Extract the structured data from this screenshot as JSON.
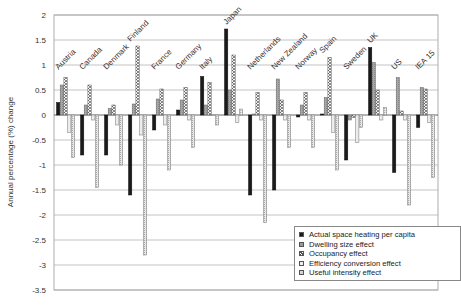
{
  "chart_data": {
    "type": "bar",
    "title": "",
    "xlabel": "",
    "ylabel": "Annual percentage (%) change",
    "ylim": [
      -3.5,
      2
    ],
    "yticks": [
      2,
      1.5,
      1,
      0.5,
      0,
      -0.5,
      -1,
      -1.5,
      -2,
      -2.5,
      -3,
      -3.5
    ],
    "grid": true,
    "legend_position": "lower right",
    "categories": [
      "Austria",
      "Canada",
      "Denmark",
      "Finland",
      "France",
      "Germany",
      "Italy",
      "Japan",
      "Netherlands",
      "New Zealand",
      "Norway",
      "Spain",
      "Sweden",
      "UK",
      "US",
      "IEA 15"
    ],
    "series": [
      {
        "name": "Actual space heating per capita",
        "pattern": "solid-black",
        "color": "#1a1a1a",
        "values": [
          0.25,
          -0.8,
          -0.8,
          -1.6,
          -0.3,
          0.1,
          0.77,
          1.72,
          -1.6,
          -1.5,
          -0.04,
          0.02,
          -0.9,
          1.35,
          -1.15,
          -0.25
        ]
      },
      {
        "name": "Dwelling size effect",
        "pattern": "grey",
        "color": "#9a9a9a",
        "values": [
          0.6,
          0.2,
          0.13,
          0.22,
          0.32,
          0.3,
          0.2,
          0.5,
          0.02,
          0.72,
          0.2,
          0.35,
          -0.1,
          1.05,
          0.75,
          0.55
        ]
      },
      {
        "name": "Occupancy effect",
        "pattern": "cross-hatch",
        "color": "#c8c8c8",
        "values": [
          0.75,
          0.6,
          0.2,
          1.38,
          0.52,
          0.55,
          0.65,
          1.2,
          0.45,
          0.3,
          0.45,
          1.15,
          -0.05,
          0.5,
          0.08,
          0.52
        ]
      },
      {
        "name": "Efficiency conversion effect",
        "pattern": "light-grey",
        "color": "#e2e2e2",
        "values": [
          -0.35,
          -0.1,
          -0.2,
          -0.4,
          -0.2,
          -0.1,
          0.0,
          -0.15,
          -0.1,
          -0.1,
          -0.1,
          -0.35,
          -0.55,
          -0.1,
          -0.1,
          -0.15
        ]
      },
      {
        "name": "Useful intensity effect",
        "pattern": "light-dotted",
        "color": "#d4d4d4",
        "values": [
          -0.85,
          -1.45,
          -1.0,
          -2.8,
          -1.1,
          -0.65,
          -0.2,
          0.12,
          -2.15,
          -0.65,
          -0.65,
          -1.1,
          -0.25,
          0.15,
          -1.8,
          -1.25
        ]
      }
    ]
  },
  "legend": {
    "items": [
      {
        "label": "Actual space heating per capita"
      },
      {
        "label": "Dwelling size effect"
      },
      {
        "label": "Occupancy effect"
      },
      {
        "label": "Efficiency conversion effect"
      },
      {
        "label": "Useful intensity effect"
      }
    ]
  }
}
